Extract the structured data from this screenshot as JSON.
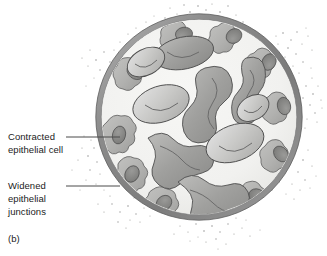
{
  "figure": {
    "panel_label": "(b)",
    "background_color": "#ffffff"
  },
  "callouts": [
    {
      "id": "contracted",
      "text": "Contracted\nepithelial cell",
      "line_from_x": 66,
      "line_to_x": 120,
      "line_y": 137,
      "color": "#1b1b1b"
    },
    {
      "id": "widened",
      "text": "Widened\nepithelial\njunctions",
      "line_from_x": 66,
      "line_to_x": 120,
      "line_y": 186,
      "color": "#1b1b1b"
    }
  ],
  "vessel": {
    "center_x": 199,
    "center_y": 117,
    "outer_radius": 103,
    "wall_thickness": 5,
    "wall_color": "#8e8e8e",
    "wall_highlight_color": "#b9b9b9",
    "wall_shadow_color": "#6f6f6f",
    "lumen_color": "#f2f2f0",
    "lumen_radius": 97
  },
  "epithelial_cells": {
    "label": "Contracted epithelial cell",
    "fill_color": "#b5b5b3",
    "outline_color": "#5d5d5d",
    "nucleus_color": "#8a8a88",
    "nucleus_outline_color": "#4c4c4c",
    "count": 11,
    "items": [
      {
        "angle_deg": 200,
        "size": 1.0
      },
      {
        "angle_deg": 232,
        "size": 0.9
      },
      {
        "angle_deg": 262,
        "size": 1.05
      },
      {
        "angle_deg": 292,
        "size": 0.95
      },
      {
        "angle_deg": 318,
        "size": 1.0
      },
      {
        "angle_deg": 348,
        "size": 0.9
      },
      {
        "angle_deg": 18,
        "size": 1.0
      },
      {
        "angle_deg": 52,
        "size": 0.95
      },
      {
        "angle_deg": 86,
        "size": 1.0
      },
      {
        "angle_deg": 120,
        "size": 0.9
      },
      {
        "angle_deg": 160,
        "size": 1.0
      }
    ]
  },
  "blood_cells": {
    "label": "Blood cells in lumen",
    "light_fill": "#cfcfcd",
    "dark_fill": "#a2a2a0",
    "outline_color": "#4f4f4f",
    "dimple_color": "#6b6b6b",
    "count": 9
  },
  "leaked_particles": {
    "label": "Leaked particles outside vessel",
    "color": "#9a9a98",
    "approximate_count": 320,
    "clusters": [
      {
        "cx": 200,
        "cy": 8,
        "spread": 34
      },
      {
        "cx": 292,
        "cy": 40,
        "spread": 26
      },
      {
        "cx": 312,
        "cy": 98,
        "spread": 22
      },
      {
        "cx": 296,
        "cy": 168,
        "spread": 26
      },
      {
        "cx": 216,
        "cy": 234,
        "spread": 30
      },
      {
        "cx": 128,
        "cy": 214,
        "spread": 26
      },
      {
        "cx": 100,
        "cy": 160,
        "spread": 24
      },
      {
        "cx": 104,
        "cy": 60,
        "spread": 26
      },
      {
        "cx": 150,
        "cy": 20,
        "spread": 22
      }
    ]
  }
}
